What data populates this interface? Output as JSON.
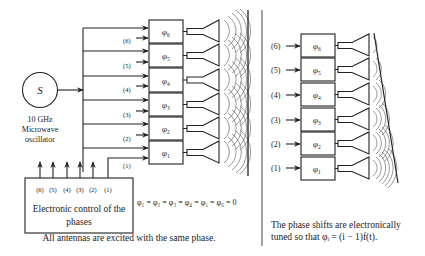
{
  "oscillator": {
    "symbol": "S",
    "label_line1": "10 GHz",
    "label_line2": "Microwave",
    "label_line3": "oscillator"
  },
  "control_box": {
    "line1": "Electronic control of the",
    "line2": "phases",
    "outputs": [
      "(6)",
      "(5)",
      "(4)",
      "(3)",
      "(2)",
      "(1)"
    ]
  },
  "left_panel": {
    "phase_shifters": [
      {
        "id": 6,
        "phi": "φ",
        "sub": "6",
        "input_label": "(6)"
      },
      {
        "id": 5,
        "phi": "φ",
        "sub": "5",
        "input_label": "(5)"
      },
      {
        "id": 4,
        "phi": "φ",
        "sub": "4",
        "input_label": "(4)"
      },
      {
        "id": 3,
        "phi": "φ",
        "sub": "3",
        "input_label": "(3)"
      },
      {
        "id": 2,
        "phi": "φ",
        "sub": "2",
        "input_label": "(2)"
      },
      {
        "id": 1,
        "phi": "φ",
        "sub": "1",
        "input_label": "(1)"
      }
    ],
    "equation": "φ₁ = φ₂ = φ₃ = φ₄ = φ₅ = φ₆ = 0",
    "caption": "All antennas are excited with the same phase."
  },
  "right_panel": {
    "phase_shifters": [
      {
        "id": 6,
        "phi": "φ",
        "sub": "6",
        "input_label": "(6)"
      },
      {
        "id": 5,
        "phi": "φ",
        "sub": "5",
        "input_label": "(5)"
      },
      {
        "id": 4,
        "phi": "φ",
        "sub": "4",
        "input_label": "(4)"
      },
      {
        "id": 3,
        "phi": "φ",
        "sub": "3",
        "input_label": "(3)"
      },
      {
        "id": 2,
        "phi": "φ",
        "sub": "2",
        "input_label": "(2)"
      },
      {
        "id": 1,
        "phi": "φ",
        "sub": "1",
        "input_label": "(1)"
      }
    ],
    "caption_line1": "The phase shifts are electronically",
    "caption_line2": "tuned so that φᵢ = (i − 1)f(t)."
  },
  "colors": {
    "ink": "#222222",
    "background": "#ffffff",
    "wave": "#555555"
  }
}
